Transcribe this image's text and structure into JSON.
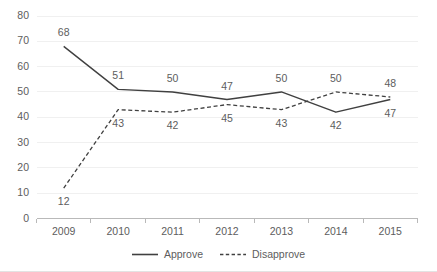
{
  "chart_data": {
    "type": "line",
    "title": "",
    "subtitle": "",
    "xlabel": "",
    "ylabel": "",
    "categories": [
      "2009",
      "2010",
      "2011",
      "2012",
      "2013",
      "2014",
      "2015"
    ],
    "series": [
      {
        "name": "Approve",
        "style": "solid",
        "color": "#404040",
        "values": [
          68,
          51,
          50,
          47,
          50,
          42,
          47
        ],
        "label_positions": [
          "above",
          "above",
          "above",
          "above",
          "above",
          "below",
          "below"
        ]
      },
      {
        "name": "Disapprove",
        "style": "dashed",
        "color": "#404040",
        "values": [
          12,
          43,
          42,
          45,
          43,
          50,
          48
        ],
        "label_positions": [
          "below",
          "below",
          "below",
          "below",
          "below",
          "above",
          "above"
        ]
      }
    ],
    "ylim": [
      0,
      80
    ],
    "yticks": [
      0,
      10,
      20,
      30,
      40,
      50,
      60,
      70,
      80
    ],
    "ytick_labels": [
      "0",
      "10",
      "20",
      "30",
      "40",
      "50",
      "60",
      "70",
      "80"
    ],
    "grid": true,
    "grid_color": "#f0f0f0",
    "axis_color": "#b9b9b9",
    "legend": {
      "position": "bottom",
      "entries": [
        "Approve",
        "Disapprove"
      ]
    }
  }
}
